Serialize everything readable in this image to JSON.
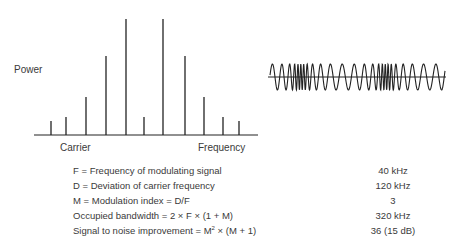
{
  "spectrum": {
    "y_label": "Power",
    "x_label_left": "Carrier",
    "x_label_right": "Frequency",
    "lines": [
      {
        "x": 51,
        "top": 121
      },
      {
        "x": 66,
        "top": 117
      },
      {
        "x": 86,
        "top": 97
      },
      {
        "x": 106,
        "top": 56
      },
      {
        "x": 126,
        "top": 19
      },
      {
        "x": 144,
        "top": 117
      },
      {
        "x": 163,
        "top": 19
      },
      {
        "x": 185,
        "top": 56
      },
      {
        "x": 204,
        "top": 97
      },
      {
        "x": 223,
        "top": 117
      },
      {
        "x": 239,
        "top": 121
      }
    ]
  },
  "waveform": {
    "description": "Frequency modulated carrier waveform"
  },
  "parameters": [
    {
      "label": "F = Frequency of modulating signal",
      "value": "40 kHz"
    },
    {
      "label": "D = Deviation of carrier frequency",
      "value": "120 kHz"
    },
    {
      "label": "M = Modulation index = D/F",
      "value": "3"
    },
    {
      "label": "Occupied bandwidth = 2 × F × (1 + M)",
      "value": "320 kHz"
    },
    {
      "label_pre": "Signal to noise improvement = M",
      "label_sup": "2",
      "label_post": " × (M + 1)",
      "value": "36 (15 dB)"
    }
  ],
  "colors": {
    "line": "#222222",
    "text": "#3a3a3a"
  }
}
